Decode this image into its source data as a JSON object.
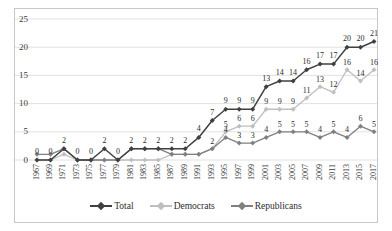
{
  "chart_data": {
    "type": "line",
    "title": "",
    "subtitle": "",
    "xlabel": "",
    "ylabel": "",
    "ylim": [
      0,
      25
    ],
    "yticks": [
      0,
      5,
      10,
      15,
      20,
      25
    ],
    "grid": "horizontal",
    "legend_position": "bottom-center",
    "categories": [
      "1967",
      "1969",
      "1971",
      "1973",
      "1975",
      "1977",
      "1979",
      "1981",
      "1983",
      "1985",
      "1987",
      "1989",
      "1991",
      "1993",
      "1995",
      "1997",
      "1999",
      "2001",
      "2003",
      "2005",
      "2007",
      "2009",
      "2011",
      "2013",
      "2015",
      "2017"
    ],
    "series": [
      {
        "name": "Total",
        "color": "#404040",
        "marker": "diamond",
        "values": [
          0,
          0,
          2,
          0,
          0,
          2,
          0,
          2,
          2,
          2,
          2,
          2,
          4,
          7,
          9,
          9,
          9,
          13,
          14,
          14,
          16,
          17,
          17,
          20,
          20,
          21
        ],
        "labels": [
          "0",
          "0",
          "2",
          "0",
          "0",
          "2",
          "0",
          "2",
          "2",
          "2",
          "2",
          "2",
          "4",
          "7",
          "9",
          "9",
          "9",
          "13",
          "14",
          "14",
          "16",
          "17",
          "17",
          "20",
          "20",
          "21"
        ]
      },
      {
        "name": "Democrats",
        "color": "#bfbfbf",
        "marker": "diamond",
        "values": [
          0,
          0,
          1,
          0,
          0,
          0,
          0,
          0,
          0,
          0,
          1,
          1,
          1,
          2,
          5,
          6,
          6,
          9,
          9,
          9,
          11,
          13,
          12,
          16,
          14,
          16
        ],
        "labels": [
          "",
          "",
          "",
          "",
          "",
          "",
          "",
          "",
          "",
          "",
          "",
          "",
          "",
          "2",
          "5",
          "6",
          "6",
          "9",
          "9",
          "9",
          "11",
          "13",
          "12",
          "16",
          "14",
          "16"
        ]
      },
      {
        "name": "Republicans",
        "color": "#808080",
        "marker": "diamond",
        "values": [
          1,
          1,
          2,
          0,
          0,
          0,
          0,
          2,
          2,
          2,
          1,
          1,
          1,
          2,
          4,
          3,
          3,
          4,
          5,
          5,
          5,
          4,
          5,
          4,
          6,
          5
        ],
        "labels": [
          "",
          "",
          "",
          "",
          "",
          "",
          "",
          "",
          "",
          "",
          "",
          "",
          "",
          "",
          "4",
          "3",
          "3",
          "4",
          "5",
          "5",
          "5",
          "4",
          "5",
          "4",
          "6",
          "5"
        ]
      }
    ]
  },
  "legend": {
    "items": [
      {
        "label": "Total"
      },
      {
        "label": "Democrats"
      },
      {
        "label": "Republicans"
      }
    ]
  },
  "axis": {
    "y_tick_labels": [
      "0",
      "5",
      "10",
      "15",
      "20",
      "25"
    ]
  }
}
